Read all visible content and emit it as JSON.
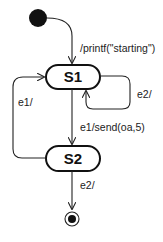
{
  "diagram": {
    "type": "uml-state-machine",
    "states": [
      {
        "id": "S1",
        "label": "S1"
      },
      {
        "id": "S2",
        "label": "S2"
      }
    ],
    "initial": {
      "target": "S1",
      "label": "/printf(\"starting\")"
    },
    "transitions": [
      {
        "from": "S1",
        "to": "S1",
        "label": "e2/"
      },
      {
        "from": "S1",
        "to": "S2",
        "label": "e1/send(oa,5)"
      },
      {
        "from": "S2",
        "to": "S1",
        "label": "e1/"
      },
      {
        "from": "S2",
        "to": "final",
        "label": "e2/"
      }
    ],
    "colors": {
      "stroke": "#222222",
      "fill": "#ffffff",
      "pseudostate": "#111111"
    }
  }
}
